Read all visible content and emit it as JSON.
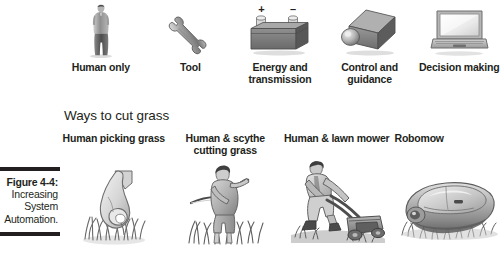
{
  "figure": {
    "caption_number": "Figure 4-4:",
    "caption_lines": [
      "Increasing",
      "System",
      "Automation."
    ]
  },
  "top_row": {
    "items": [
      {
        "icon": "human-figure-icon",
        "label": "Human only"
      },
      {
        "icon": "wrench-icon",
        "label": "Tool"
      },
      {
        "icon": "battery-icon",
        "label": "Energy and transmission",
        "plus": "+",
        "minus": "–"
      },
      {
        "icon": "camera-sensor-icon",
        "label": "Control and guidance"
      },
      {
        "icon": "laptop-icon",
        "label": "Decision making"
      }
    ]
  },
  "section": {
    "title": "Ways to cut grass"
  },
  "bottom_row": {
    "items": [
      {
        "icon": "hand-picking-grass-icon",
        "label": "Human picking grass"
      },
      {
        "icon": "human-scythe-icon",
        "label": "Human & scythe cutting grass"
      },
      {
        "icon": "human-lawn-mower-icon",
        "label": "Human & lawn mower"
      },
      {
        "icon": "robomow-icon",
        "label": "Robomow"
      }
    ]
  },
  "colors": {
    "ink": "#231f20",
    "background": "#ffffff",
    "gray_light": "#d8d8d8",
    "gray_mid": "#9a9a9a",
    "gray_dark": "#6b6b6b"
  }
}
